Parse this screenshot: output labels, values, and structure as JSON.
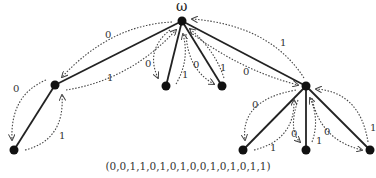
{
  "diagram": {
    "root_label": "ω",
    "caption": "(0,0,1,1,0,1,0,1,0,0,1,0,1,0,1,1)",
    "nodes": [
      {
        "id": "root",
        "x": 182,
        "y": 21
      },
      {
        "id": "L",
        "x": 55,
        "y": 85
      },
      {
        "id": "LL",
        "x": 14,
        "y": 150
      },
      {
        "id": "M1",
        "x": 166,
        "y": 86
      },
      {
        "id": "M2",
        "x": 222,
        "y": 86
      },
      {
        "id": "R",
        "x": 306,
        "y": 86
      },
      {
        "id": "R1",
        "x": 243,
        "y": 150
      },
      {
        "id": "R2",
        "x": 306,
        "y": 150
      },
      {
        "id": "R3",
        "x": 370,
        "y": 150
      }
    ],
    "arc_labels": {
      "root_L_down": "0",
      "root_L_up": "1",
      "L_LL_down": "0",
      "L_LL_up": "1",
      "root_M1_down": "0",
      "root_M1_up": "1",
      "root_M2_down": "0",
      "root_M2_up": "1",
      "root_R_down": "0",
      "root_R_up": "1",
      "R_R1_down": "0",
      "R_R1_up": "1",
      "R_R2_down": "0",
      "R_R2_up": "1",
      "R_R3_down": "0",
      "R_R3_up": "1"
    }
  }
}
